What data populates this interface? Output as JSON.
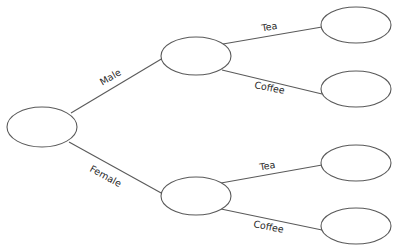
{
  "diagram": {
    "type": "tree-diagram",
    "colors": {
      "stroke": "#5a5a5a",
      "text": "#2a2a2a",
      "background": "#ffffff"
    },
    "nodes": [
      {
        "id": "root",
        "label": "",
        "cx": 42,
        "cy": 127
      },
      {
        "id": "male",
        "label": "",
        "cx": 196,
        "cy": 56
      },
      {
        "id": "female",
        "label": "",
        "cx": 196,
        "cy": 196
      },
      {
        "id": "male-tea",
        "label": "",
        "cx": 356,
        "cy": 25
      },
      {
        "id": "male-coffee",
        "label": "",
        "cx": 356,
        "cy": 89
      },
      {
        "id": "female-tea",
        "label": "",
        "cx": 356,
        "cy": 163
      },
      {
        "id": "female-coffee",
        "label": "",
        "cx": 356,
        "cy": 226
      }
    ],
    "edges": [
      {
        "from": "root",
        "to": "male",
        "label": "Male"
      },
      {
        "from": "root",
        "to": "female",
        "label": "Female"
      },
      {
        "from": "male",
        "to": "male-tea",
        "label": "Tea"
      },
      {
        "from": "male",
        "to": "male-coffee",
        "label": "Coffee"
      },
      {
        "from": "female",
        "to": "female-tea",
        "label": "Tea"
      },
      {
        "from": "female",
        "to": "female-coffee",
        "label": "Coffee"
      }
    ]
  }
}
